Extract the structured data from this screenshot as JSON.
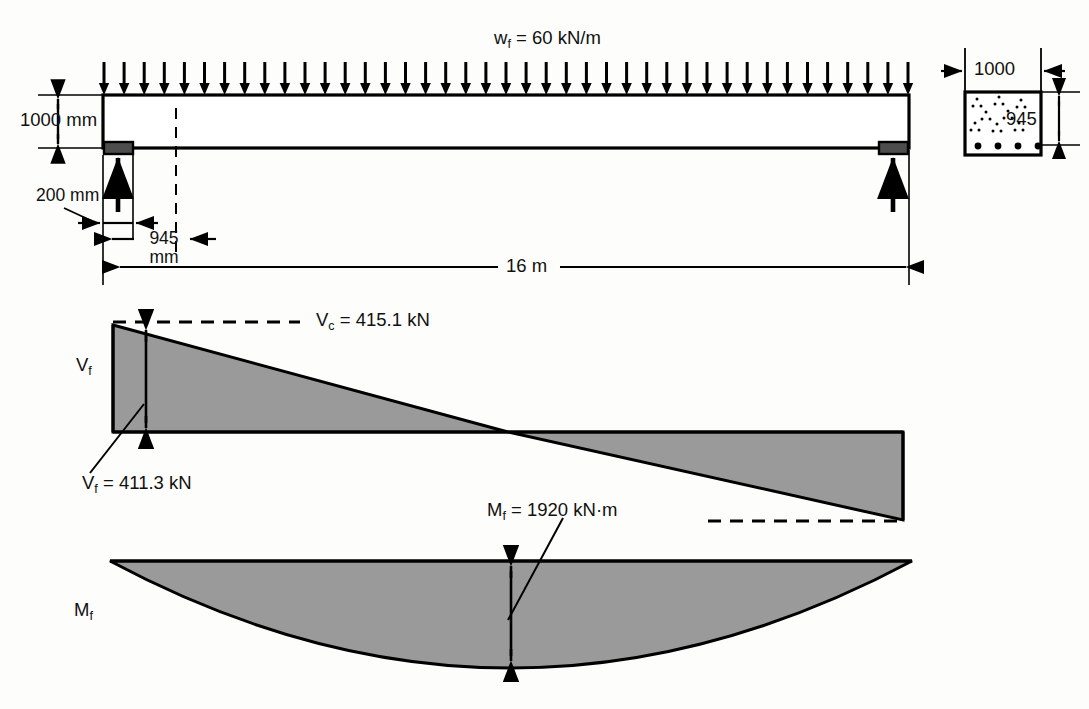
{
  "figure": {
    "kind": "structural-engineering-beam-diagram"
  },
  "beam": {
    "load_label_prefix": "w",
    "load_label_sub": "f",
    "load_label_value": " = 60 kN/m",
    "load_arrow_count": 41,
    "depth_label": "1000 mm",
    "bearing_label": "200 mm",
    "offset_label_line1": "945",
    "offset_label_line2": "mm",
    "span_label": "16 m"
  },
  "section": {
    "width_label": "1000",
    "depth_label": "945",
    "rebar_count": 4
  },
  "shear": {
    "axis_label_prefix": "V",
    "axis_label_sub": "f",
    "vc_prefix": "V",
    "vc_sub": "c",
    "vc_value": " = 415.1 kN",
    "vf_prefix": "V",
    "vf_sub": "f",
    "vf_value": " = 411.3 kN"
  },
  "moment": {
    "axis_label_prefix": "M",
    "axis_label_sub": "f",
    "mf_prefix": "M",
    "mf_sub": "f",
    "mf_value": " = 1920 kN·m"
  },
  "colors": {
    "fill": "#9a9a9a",
    "outline": "#000000",
    "bearing": "#4d4d4d",
    "background": "#fdfdfb"
  }
}
